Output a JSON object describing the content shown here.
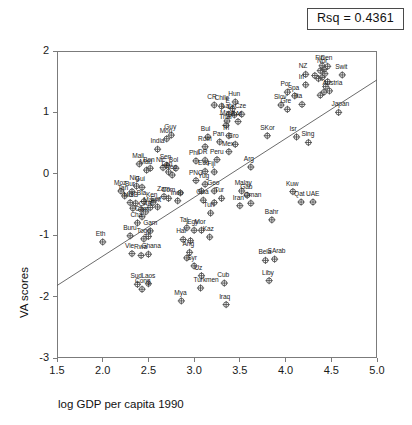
{
  "figure": {
    "rsq_label": "Rsq = 0.4361",
    "marker_style": "circle-plus",
    "marker_color": "#4d4d4d",
    "frame_color": "#7b7b7b",
    "fit_line_color": "#5a5a5a"
  },
  "chart_data": {
    "type": "scatter",
    "title": "",
    "subtitle": "",
    "xlabel": "log GDP per capita 1990",
    "ylabel": "VA scores",
    "xlim": [
      1.5,
      5.0
    ],
    "ylim": [
      -3,
      2
    ],
    "xticks": [
      1.5,
      2.0,
      2.5,
      3.0,
      3.5,
      4.0,
      4.5,
      5.0
    ],
    "yticks": [
      2,
      1,
      0,
      -1,
      -2,
      -3
    ],
    "xticklabels": [
      "1.5",
      "2.0",
      "2.5",
      "3.0",
      "3.5",
      "4.0",
      "4.5",
      "5.0"
    ],
    "yticklabels": [
      "2",
      "1",
      "0",
      "-1",
      "-2",
      "-3"
    ],
    "grid": false,
    "legend": false,
    "annotations": [
      {
        "text": "Rsq = 0.4361",
        "position": "top-right",
        "boxed": true
      }
    ],
    "fit_line": {
      "type": "linear",
      "r_squared": 0.4361,
      "endpoints": [
        [
          1.5,
          -1.82
        ],
        [
          5.0,
          1.53
        ]
      ],
      "slope": 0.957,
      "intercept": -3.255
    },
    "point_label_key": "country abbreviation",
    "points": [
      {
        "label": "Eth",
        "x": 2.0,
        "y": -1.11
      },
      {
        "label": "Moz",
        "x": 2.2,
        "y": -0.28
      },
      {
        "label": "Tan",
        "x": 2.24,
        "y": -0.36
      },
      {
        "label": "Bur",
        "x": 2.32,
        "y": -0.29
      },
      {
        "label": "Mali",
        "x": 2.4,
        "y": 0.16
      },
      {
        "label": "Nig",
        "x": 2.37,
        "y": -0.2
      },
      {
        "label": "Gui",
        "x": 2.43,
        "y": -0.22
      },
      {
        "label": "Mad",
        "x": 2.48,
        "y": 0.06
      },
      {
        "label": "Ben",
        "x": 2.52,
        "y": 0.09
      },
      {
        "label": "Mul",
        "x": 2.3,
        "y": -0.47
      },
      {
        "label": "GB",
        "x": 2.36,
        "y": -0.48
      },
      {
        "label": "Bla",
        "x": 2.45,
        "y": -0.45
      },
      {
        "label": "Ken",
        "x": 2.55,
        "y": -0.47
      },
      {
        "label": "Gui2",
        "x": 2.33,
        "y": -0.56
      },
      {
        "label": "Ug",
        "x": 2.42,
        "y": -0.58
      },
      {
        "label": "Maurit",
        "x": 2.52,
        "y": -0.55
      },
      {
        "label": "Sor",
        "x": 2.6,
        "y": -0.54
      },
      {
        "label": "CAR",
        "x": 2.47,
        "y": -0.62
      },
      {
        "label": "Cam",
        "x": 2.43,
        "y": -0.7
      },
      {
        "label": "Cha",
        "x": 2.38,
        "y": -0.8
      },
      {
        "label": "Buru",
        "x": 2.3,
        "y": -1.01
      },
      {
        "label": "Togo",
        "x": 2.45,
        "y": -1.06
      },
      {
        "label": "Gam",
        "x": 2.52,
        "y": -0.93
      },
      {
        "label": "Mali2",
        "x": 2.5,
        "y": -1.02
      },
      {
        "label": "Vie",
        "x": 2.32,
        "y": -1.3
      },
      {
        "label": "Rwa",
        "x": 2.42,
        "y": -1.33
      },
      {
        "label": "Ghana",
        "x": 2.5,
        "y": -1.31
      },
      {
        "label": "Sud",
        "x": 2.38,
        "y": -1.8
      },
      {
        "label": "Cong",
        "x": 2.43,
        "y": -1.88
      },
      {
        "label": "Laos",
        "x": 2.5,
        "y": -1.79
      },
      {
        "label": "India",
        "x": 2.6,
        "y": 0.4
      },
      {
        "label": "Mon",
        "x": 2.7,
        "y": 0.57
      },
      {
        "label": "Guy",
        "x": 2.75,
        "y": 0.63
      },
      {
        "label": "Sen",
        "x": 2.7,
        "y": 0.14
      },
      {
        "label": "Nic",
        "x": 2.66,
        "y": 0.1
      },
      {
        "label": "Lan",
        "x": 2.72,
        "y": 0.03
      },
      {
        "label": "Bol",
        "x": 2.8,
        "y": 0.09
      },
      {
        "label": "Nep",
        "x": 2.76,
        "y": -0.02
      },
      {
        "label": "Zam",
        "x": 2.67,
        "y": -0.37
      },
      {
        "label": "Com",
        "x": 2.72,
        "y": -0.4
      },
      {
        "label": "Indo",
        "x": 2.82,
        "y": -0.44
      },
      {
        "label": "Moz2",
        "x": 2.85,
        "y": -0.31
      },
      {
        "label": "Taj",
        "x": 2.92,
        "y": -0.88
      },
      {
        "label": "Hai",
        "x": 2.88,
        "y": -1.07
      },
      {
        "label": "Cam2",
        "x": 2.96,
        "y": -1.09
      },
      {
        "label": "Ang",
        "x": 2.95,
        "y": -1.28
      },
      {
        "label": "Zim",
        "x": 2.92,
        "y": -1.37
      },
      {
        "label": "Syr",
        "x": 3.0,
        "y": -1.5
      },
      {
        "label": "Mya",
        "x": 2.86,
        "y": -2.07
      },
      {
        "label": "Turkmen",
        "x": 3.07,
        "y": -1.86
      },
      {
        "label": "Uz",
        "x": 3.08,
        "y": -1.66
      },
      {
        "label": "Egy",
        "x": 3.0,
        "y": -0.92
      },
      {
        "label": "Mor",
        "x": 3.08,
        "y": -0.92
      },
      {
        "label": "Kaz",
        "x": 3.17,
        "y": -1.03
      },
      {
        "label": "Tun",
        "x": 3.18,
        "y": -0.64
      },
      {
        "label": "Phil",
        "x": 3.02,
        "y": 0.21
      },
      {
        "label": "DR",
        "x": 3.12,
        "y": 0.22
      },
      {
        "label": "Ecu",
        "x": 3.12,
        "y": 0.04
      },
      {
        "label": "Fiji",
        "x": 3.22,
        "y": 0.03
      },
      {
        "label": "PNG",
        "x": 3.02,
        "y": -0.11
      },
      {
        "label": "Yug",
        "x": 3.12,
        "y": -0.17
      },
      {
        "label": "Mal2",
        "x": 3.08,
        "y": -0.28
      },
      {
        "label": "Geo",
        "x": 3.22,
        "y": -0.28
      },
      {
        "label": "Gua",
        "x": 3.1,
        "y": -0.43
      },
      {
        "label": "Tur",
        "x": 3.3,
        "y": -0.4
      },
      {
        "label": "Bol2",
        "x": 3.22,
        "y": -0.47
      },
      {
        "label": "Bul",
        "x": 3.15,
        "y": 0.6
      },
      {
        "label": "Rom",
        "x": 3.12,
        "y": 0.44
      },
      {
        "label": "Pan",
        "x": 3.28,
        "y": 0.52
      },
      {
        "label": "Peru",
        "x": 3.25,
        "y": 0.23
      },
      {
        "label": "Cro",
        "x": 3.45,
        "y": 0.48
      },
      {
        "label": "Mex",
        "x": 3.38,
        "y": 0.36
      },
      {
        "label": "Tri",
        "x": 3.38,
        "y": 0.62
      },
      {
        "label": "CR",
        "x": 3.22,
        "y": 1.12
      },
      {
        "label": "Chile",
        "x": 3.3,
        "y": 1.1
      },
      {
        "label": "Hun",
        "x": 3.45,
        "y": 1.17
      },
      {
        "label": "E",
        "x": 3.42,
        "y": 1.06
      },
      {
        "label": "Lat",
        "x": 3.38,
        "y": 0.97
      },
      {
        "label": "Lit",
        "x": 3.44,
        "y": 0.96
      },
      {
        "label": "Cze",
        "x": 3.52,
        "y": 0.97
      },
      {
        "label": "Maur",
        "x": 3.36,
        "y": 0.86
      },
      {
        "label": "SAf",
        "x": 3.48,
        "y": 0.85
      },
      {
        "label": "Thai",
        "x": 3.35,
        "y": 0.79
      },
      {
        "label": "Malay",
        "x": 3.52,
        "y": -0.28
      },
      {
        "label": "Gab",
        "x": 3.58,
        "y": -0.35
      },
      {
        "label": "Oman",
        "x": 3.62,
        "y": -0.48
      },
      {
        "label": "Iran",
        "x": 3.5,
        "y": -0.52
      },
      {
        "label": "Arg",
        "x": 3.62,
        "y": 0.11
      },
      {
        "label": "Bela",
        "x": 3.78,
        "y": -1.41
      },
      {
        "label": "Cub",
        "x": 3.33,
        "y": -1.78
      },
      {
        "label": "Iraq",
        "x": 3.35,
        "y": -2.13
      },
      {
        "label": "Liby",
        "x": 3.82,
        "y": -1.74
      },
      {
        "label": "SArab",
        "x": 3.88,
        "y": -1.39
      },
      {
        "label": "Bahr",
        "x": 3.85,
        "y": -0.75
      },
      {
        "label": "SKor",
        "x": 3.8,
        "y": 0.62
      },
      {
        "label": "Isr",
        "x": 4.12,
        "y": 0.6
      },
      {
        "label": "Sing",
        "x": 4.25,
        "y": 0.51
      },
      {
        "label": "Kuw",
        "x": 4.08,
        "y": -0.29
      },
      {
        "label": "Qat",
        "x": 4.17,
        "y": -0.46
      },
      {
        "label": "UAE",
        "x": 4.3,
        "y": -0.46
      },
      {
        "label": "Por",
        "x": 4.02,
        "y": 1.33
      },
      {
        "label": "Spa",
        "x": 4.1,
        "y": 1.27
      },
      {
        "label": "Slov",
        "x": 3.95,
        "y": 1.12
      },
      {
        "label": "Gre",
        "x": 4.02,
        "y": 1.05
      },
      {
        "label": "Ita",
        "x": 4.18,
        "y": 1.13
      },
      {
        "label": "Irl",
        "x": 4.22,
        "y": 1.45
      },
      {
        "label": "NZ",
        "x": 4.22,
        "y": 1.62
      },
      {
        "label": "Aus",
        "x": 4.32,
        "y": 1.6
      },
      {
        "label": "UK",
        "x": 4.36,
        "y": 1.55
      },
      {
        "label": "Can",
        "x": 4.4,
        "y": 1.57
      },
      {
        "label": "Net",
        "x": 4.38,
        "y": 1.68
      },
      {
        "label": "Nor",
        "x": 4.42,
        "y": 1.7
      },
      {
        "label": "Fin",
        "x": 4.4,
        "y": 1.76
      },
      {
        "label": "Den",
        "x": 4.46,
        "y": 1.75
      },
      {
        "label": "Swe",
        "x": 4.43,
        "y": 1.63
      },
      {
        "label": "US",
        "x": 4.46,
        "y": 1.5
      },
      {
        "label": "Ger",
        "x": 4.44,
        "y": 1.42
      },
      {
        "label": "Austria",
        "x": 4.48,
        "y": 1.35
      },
      {
        "label": "Bel",
        "x": 4.42,
        "y": 1.33
      },
      {
        "label": "Fra",
        "x": 4.38,
        "y": 1.28
      },
      {
        "label": "Swit",
        "x": 4.62,
        "y": 1.61
      },
      {
        "label": "Japan",
        "x": 4.58,
        "y": 1.0
      }
    ],
    "point_labels_visible": [
      "Eth",
      "Moz",
      "Tan",
      "Bur",
      "Mali",
      "Nig",
      "Gui",
      "Mad",
      "Ben",
      "Mul",
      "GB",
      "Bla",
      "Ken",
      "Maurit",
      "Sor",
      "CAR",
      "Cam",
      "Cha",
      "Buru",
      "Togo",
      "Gam",
      "Vie",
      "Rwa",
      "Ghana",
      "Sud",
      "Cong",
      "Laos",
      "India",
      "Mon",
      "Guy",
      "Sen",
      "Nic",
      "Lan",
      "Bol",
      "Nep",
      "Zam",
      "Com",
      "Indo",
      "Taj",
      "Hai",
      "Ang",
      "Syr",
      "Mya",
      "Turkmen",
      "Uz",
      "Egy",
      "Mor",
      "Kaz",
      "Tun",
      "Phil",
      "DR",
      "Ecu",
      "Fiji",
      "PNG",
      "Yug",
      "Geo",
      "Gua",
      "Tur",
      "Bul",
      "Rom",
      "Pan",
      "Peru",
      "Cro",
      "Mex",
      "Tri",
      "CR",
      "Chile",
      "Hun",
      "E",
      "Lat",
      "Lit",
      "Cze",
      "Maur",
      "SAf",
      "Thai",
      "Malay",
      "Gab",
      "Oman",
      "Iran",
      "Arg",
      "Bela",
      "Cub",
      "Iraq",
      "Liby",
      "SArab",
      "Bahr",
      "SKor",
      "Isr",
      "Sing",
      "Kuw",
      "Qat",
      "UAE",
      "Por",
      "Spa",
      "Slov",
      "Gre",
      "Ita",
      "Irl",
      "NZ",
      "Swit",
      "Japan",
      "Fin",
      "Den",
      "Nor",
      "Austria"
    ]
  }
}
